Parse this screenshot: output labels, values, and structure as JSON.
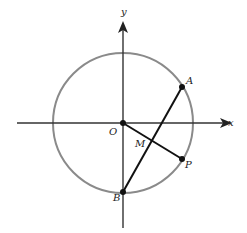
{
  "diagram": {
    "type": "geometry",
    "colors": {
      "circle": "#8a8a8a",
      "axes": "#333333",
      "segments": "#111111",
      "points": "#111111"
    },
    "axes": {
      "x_label": "x",
      "y_label": "y"
    },
    "points": {
      "O": "O",
      "A": "A",
      "B": "B",
      "M": "M",
      "P": "P"
    },
    "segments": [
      "AB",
      "OP"
    ]
  }
}
